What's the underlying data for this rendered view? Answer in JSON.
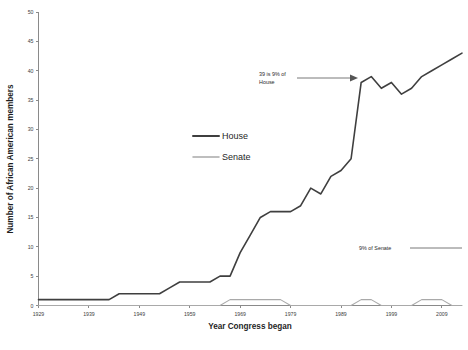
{
  "chart_data": {
    "type": "line",
    "title": "",
    "xlabel": "Year Congress began",
    "ylabel": "Number of African American members",
    "xlim": [
      1929,
      2013
    ],
    "ylim": [
      0,
      50
    ],
    "xticks": [
      1929,
      1939,
      1949,
      1959,
      1969,
      1979,
      1989,
      1999,
      2009
    ],
    "xtick_labels": [
      "1929",
      "1939",
      "1949",
      "1959",
      "1969",
      "1979",
      "1989",
      "1999",
      "2009"
    ],
    "yticks": [
      0,
      5,
      10,
      15,
      20,
      25,
      30,
      35,
      40,
      45,
      50
    ],
    "ytick_labels": [
      "0",
      "5",
      "10",
      "15",
      "20",
      "25",
      "30",
      "35",
      "40",
      "45",
      "50"
    ],
    "grid": false,
    "legend_position": "center",
    "x": [
      1929,
      1931,
      1933,
      1935,
      1937,
      1939,
      1941,
      1943,
      1945,
      1947,
      1949,
      1951,
      1953,
      1955,
      1957,
      1959,
      1961,
      1963,
      1965,
      1967,
      1969,
      1971,
      1973,
      1975,
      1977,
      1979,
      1981,
      1983,
      1985,
      1987,
      1989,
      1991,
      1993,
      1995,
      1997,
      1999,
      2001,
      2003,
      2005,
      2007,
      2009,
      2011,
      2013
    ],
    "series": [
      {
        "name": "House",
        "color": "#3f3f3f",
        "width": 1.6,
        "values": [
          1,
          1,
          1,
          1,
          1,
          1,
          1,
          1,
          2,
          2,
          2,
          2,
          2,
          3,
          4,
          4,
          4,
          4,
          5,
          5,
          9,
          12,
          15,
          16,
          16,
          16,
          17,
          20,
          19,
          22,
          23,
          25,
          38,
          39,
          37,
          38,
          36,
          37,
          39,
          40,
          41,
          42,
          43
        ]
      },
      {
        "name": "Senate",
        "color": "#a9a9a9",
        "width": 1.1,
        "values": [
          0,
          0,
          0,
          0,
          0,
          0,
          0,
          0,
          0,
          0,
          0,
          0,
          0,
          0,
          0,
          0,
          0,
          0,
          0,
          1,
          1,
          1,
          1,
          1,
          1,
          0,
          0,
          0,
          0,
          0,
          0,
          0,
          1,
          1,
          0,
          0,
          0,
          0,
          1,
          1,
          1,
          0,
          0
        ]
      }
    ],
    "annotations": [
      {
        "id": "house-peak-annotation",
        "text_line1": "39 is 9% of",
        "text_line2": "House",
        "arrow": true
      },
      {
        "id": "senate-reference-annotation",
        "text_line1": "9% of Senate",
        "text_line2": "",
        "arrow": false
      }
    ]
  },
  "legend": {
    "items": [
      {
        "label": "House"
      },
      {
        "label": "Senate"
      }
    ]
  },
  "caption": {
    "text": ""
  }
}
